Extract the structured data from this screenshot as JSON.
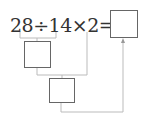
{
  "expression": {
    "text": "28÷14×2=",
    "operands": [
      "28",
      "14",
      "2"
    ],
    "operators": [
      "÷",
      "×",
      "="
    ]
  },
  "boxes": {
    "answer": "",
    "step1": "",
    "step2": ""
  },
  "colors": {
    "text": "#333333",
    "box_border": "#666666",
    "connector": "#bbbbbb"
  }
}
